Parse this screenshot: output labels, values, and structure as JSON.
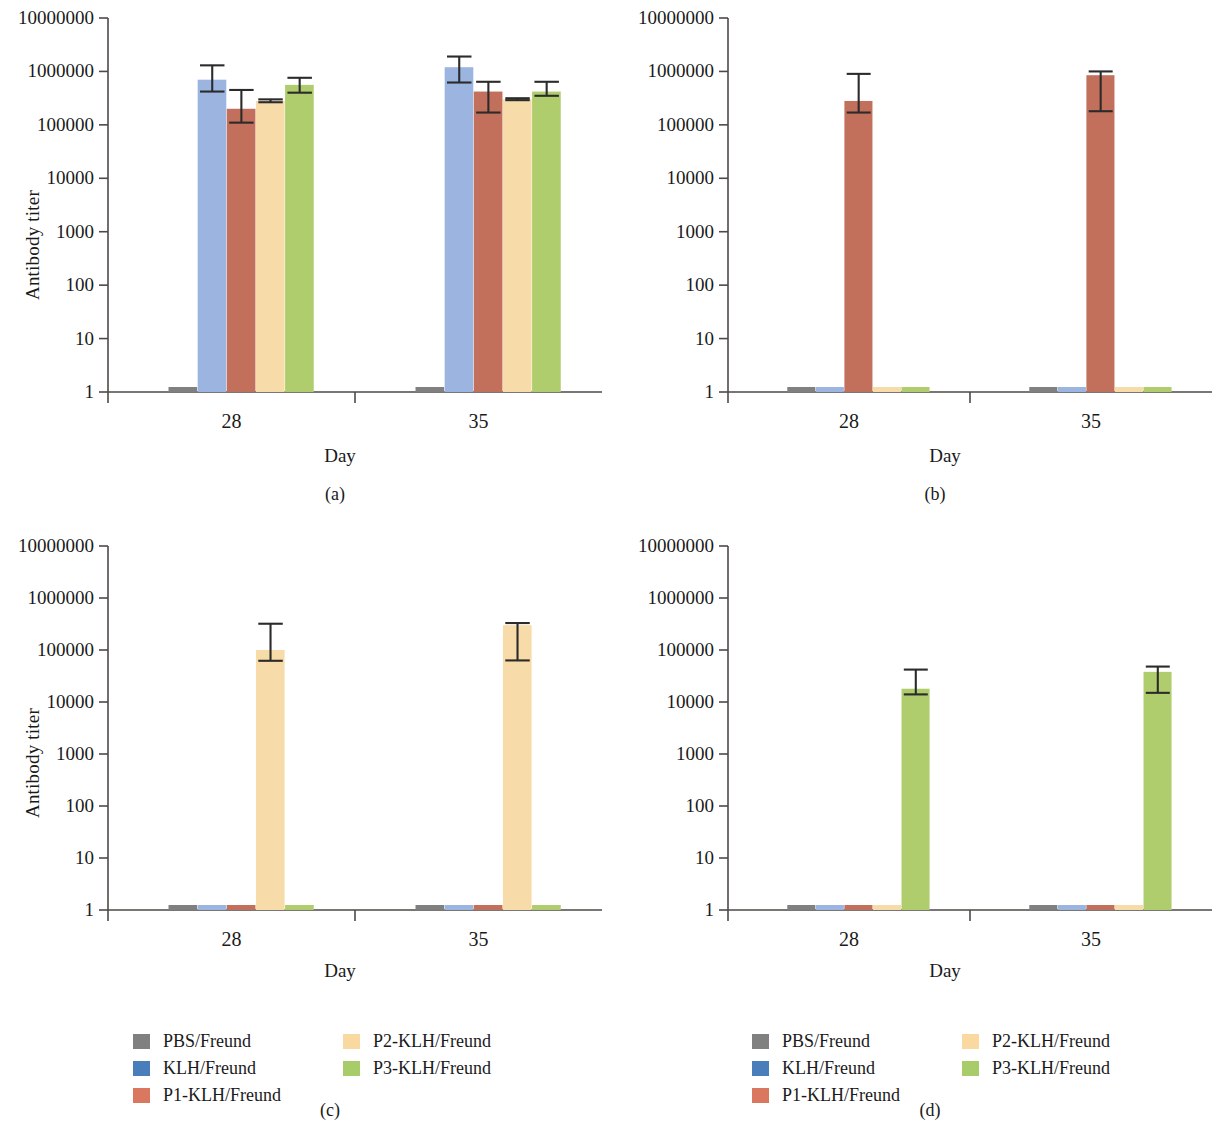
{
  "figure": {
    "y_axis_label": "Antibody titer",
    "x_axis_label": "Day",
    "panel_labels": {
      "a": "(a)",
      "b": "(b)",
      "c": "(c)",
      "d": "(d)"
    }
  },
  "legend": {
    "column_left": [
      {
        "label": "PBS/Freund",
        "color": "#808080"
      },
      {
        "label": "KLH/Freund",
        "color": "#4a7ebb"
      },
      {
        "label": "P1-KLH/Freund",
        "color": "#d9775f"
      }
    ],
    "column_right": [
      {
        "label": "P2-KLH/Freund",
        "color": "#fad9a0"
      },
      {
        "label": "P3-KLH/Freund",
        "color": "#a9cc6a"
      }
    ]
  },
  "colors": {
    "pbs": "#808080",
    "klh": "#9bb5e0",
    "p1": "#c2705c",
    "p2": "#f7dba8",
    "p3": "#b0cd6e",
    "axis": "#4d4a46",
    "error_bar": "#2b2b2b"
  },
  "chart_data": [
    {
      "type": "bar",
      "panel": "(a)",
      "title": "",
      "xlabel": "Day",
      "ylabel": "Antibody titer",
      "yscale": "log",
      "ylim": [
        1,
        10000000
      ],
      "yticks": [
        1,
        10,
        100,
        1000,
        10000,
        100000,
        1000000,
        10000000
      ],
      "ytick_labels": [
        "1",
        "10",
        "100",
        "1000",
        "10000",
        "100000",
        "1000000",
        "10000000"
      ],
      "categories": [
        "28",
        "35"
      ],
      "grid": false,
      "legend_position": "below-figure",
      "series": [
        {
          "name": "PBS/Freund",
          "color": "#808080",
          "values": [
            1,
            1
          ],
          "err_low": [
            1,
            1
          ],
          "err_high": [
            1,
            1
          ]
        },
        {
          "name": "KLH/Freund",
          "color": "#9bb5e0",
          "values": [
            700000,
            1200000
          ],
          "err_low": [
            420000,
            620000
          ],
          "err_high": [
            1300000,
            1900000
          ]
        },
        {
          "name": "P1-KLH/Freund",
          "color": "#c2705c",
          "values": [
            200000,
            420000
          ],
          "err_low": [
            110000,
            170000
          ],
          "err_high": [
            450000,
            640000
          ]
        },
        {
          "name": "P2-KLH/Freund",
          "color": "#f7dba8",
          "values": [
            280000,
            300000
          ],
          "err_low": [
            265000,
            290000
          ],
          "err_high": [
            300000,
            315000
          ]
        },
        {
          "name": "P3-KLH/Freund",
          "color": "#b0cd6e",
          "values": [
            560000,
            420000
          ],
          "err_low": [
            400000,
            350000
          ],
          "err_high": [
            760000,
            640000
          ]
        }
      ]
    },
    {
      "type": "bar",
      "panel": "(b)",
      "title": "",
      "xlabel": "Day",
      "ylabel": "",
      "yscale": "log",
      "ylim": [
        1,
        10000000
      ],
      "yticks": [
        1,
        10,
        100,
        1000,
        10000,
        100000,
        1000000,
        10000000
      ],
      "ytick_labels": [
        "1",
        "10",
        "100",
        "1000",
        "10000",
        "100000",
        "1000000",
        "10000000"
      ],
      "categories": [
        "28",
        "35"
      ],
      "grid": false,
      "series": [
        {
          "name": "PBS/Freund",
          "color": "#808080",
          "values": [
            1,
            1
          ],
          "err_low": [
            1,
            1
          ],
          "err_high": [
            1,
            1
          ]
        },
        {
          "name": "KLH/Freund",
          "color": "#9bb5e0",
          "values": [
            1,
            1
          ],
          "err_low": [
            1,
            1
          ],
          "err_high": [
            1,
            1
          ]
        },
        {
          "name": "P1-KLH/Freund",
          "color": "#c2705c",
          "values": [
            280000,
            850000
          ],
          "err_low": [
            170000,
            180000
          ],
          "err_high": [
            900000,
            1000000
          ]
        },
        {
          "name": "P2-KLH/Freund",
          "color": "#f7dba8",
          "values": [
            1,
            1
          ],
          "err_low": [
            1,
            1
          ],
          "err_high": [
            1,
            1
          ]
        },
        {
          "name": "P3-KLH/Freund",
          "color": "#b0cd6e",
          "values": [
            1,
            1
          ],
          "err_low": [
            1,
            1
          ],
          "err_high": [
            1,
            1
          ]
        }
      ]
    },
    {
      "type": "bar",
      "panel": "(c)",
      "title": "",
      "xlabel": "Day",
      "ylabel": "Antibody titer",
      "yscale": "log",
      "ylim": [
        1,
        10000000
      ],
      "yticks": [
        1,
        10,
        100,
        1000,
        10000,
        100000,
        1000000,
        10000000
      ],
      "ytick_labels": [
        "1",
        "10",
        "100",
        "1000",
        "10000",
        "100000",
        "1000000",
        "10000000"
      ],
      "categories": [
        "28",
        "35"
      ],
      "grid": false,
      "series": [
        {
          "name": "PBS/Freund",
          "color": "#808080",
          "values": [
            1,
            1
          ],
          "err_low": [
            1,
            1
          ],
          "err_high": [
            1,
            1
          ]
        },
        {
          "name": "KLH/Freund",
          "color": "#9bb5e0",
          "values": [
            1,
            1
          ],
          "err_low": [
            1,
            1
          ],
          "err_high": [
            1,
            1
          ]
        },
        {
          "name": "P1-KLH/Freund",
          "color": "#c2705c",
          "values": [
            1,
            1
          ],
          "err_low": [
            1,
            1
          ],
          "err_high": [
            1,
            1
          ]
        },
        {
          "name": "P2-KLH/Freund",
          "color": "#f7dba8",
          "values": [
            100000,
            300000
          ],
          "err_low": [
            62000,
            63000
          ],
          "err_high": [
            320000,
            330000
          ]
        },
        {
          "name": "P3-KLH/Freund",
          "color": "#b0cd6e",
          "values": [
            1,
            1
          ],
          "err_low": [
            1,
            1
          ],
          "err_high": [
            1,
            1
          ]
        }
      ]
    },
    {
      "type": "bar",
      "panel": "(d)",
      "title": "",
      "xlabel": "Day",
      "ylabel": "",
      "yscale": "log",
      "ylim": [
        1,
        10000000
      ],
      "yticks": [
        1,
        10,
        100,
        1000,
        10000,
        100000,
        1000000,
        10000000
      ],
      "ytick_labels": [
        "1",
        "10",
        "100",
        "1000",
        "10000",
        "100000",
        "1000000",
        "10000000"
      ],
      "categories": [
        "28",
        "35"
      ],
      "grid": false,
      "series": [
        {
          "name": "PBS/Freund",
          "color": "#808080",
          "values": [
            1,
            1
          ],
          "err_low": [
            1,
            1
          ],
          "err_high": [
            1,
            1
          ]
        },
        {
          "name": "KLH/Freund",
          "color": "#9bb5e0",
          "values": [
            1,
            1
          ],
          "err_low": [
            1,
            1
          ],
          "err_high": [
            1,
            1
          ]
        },
        {
          "name": "P1-KLH/Freund",
          "color": "#c2705c",
          "values": [
            1,
            1
          ],
          "err_low": [
            1,
            1
          ],
          "err_high": [
            1,
            1
          ]
        },
        {
          "name": "P2-KLH/Freund",
          "color": "#f7dba8",
          "values": [
            1,
            1
          ],
          "err_low": [
            1,
            1
          ],
          "err_high": [
            1,
            1
          ]
        },
        {
          "name": "P3-KLH/Freund",
          "color": "#b0cd6e",
          "values": [
            18000,
            38000
          ],
          "err_low": [
            14000,
            15000
          ],
          "err_high": [
            42000,
            48000
          ]
        }
      ]
    }
  ]
}
